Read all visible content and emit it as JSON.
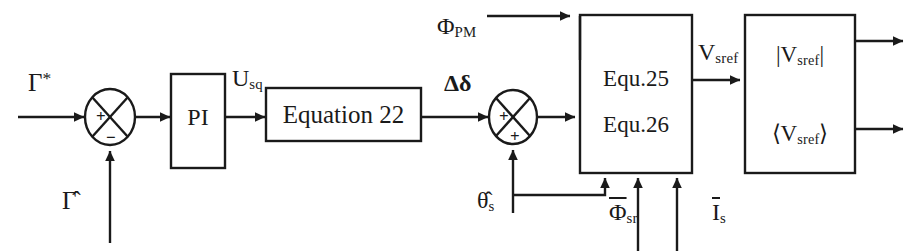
{
  "diagram": {
    "line_color": "#1a1a1a",
    "text_color": "#1a1a1a",
    "background_color": "#ffffff"
  },
  "blocks": [
    {
      "id": "pi",
      "label": "PI",
      "x": 171,
      "y": 74,
      "w": 54,
      "h": 94
    },
    {
      "id": "equation22",
      "label": "Equation 22",
      "x": 266,
      "y": 88,
      "w": 155,
      "h": 53
    },
    {
      "id": "equ2526",
      "label_line1": "Equ.25",
      "label_line2": "Equ.26",
      "x": 580,
      "y": 15,
      "w": 112,
      "h": 158
    },
    {
      "id": "vsref_out",
      "label_line1": "|V",
      "label_line1_sub": "sref",
      "label_line1_tail": "|",
      "label_line2": "⟨V",
      "label_line2_sub": "sref",
      "label_line2_tail": "⟩",
      "x": 745,
      "y": 15,
      "w": 110,
      "h": 158
    }
  ],
  "summing_junctions": [
    {
      "id": "sum1",
      "cx": 110,
      "cy": 117,
      "rx": 25,
      "ry": 28,
      "left_sign": "+",
      "bottom_sign": "−"
    },
    {
      "id": "sum2",
      "cx": 513,
      "cy": 117,
      "rx": 24,
      "ry": 27,
      "left_sign": "+",
      "bottom_sign": "+"
    }
  ],
  "signals": {
    "torque_ref": {
      "base": "Γ",
      "sup": "*",
      "x": 28,
      "y": 78
    },
    "torque_est": {
      "base": "Γ̂",
      "x": 63,
      "y": 197
    },
    "pi_output": {
      "base": "U",
      "sub": "sq",
      "x": 232,
      "y": 73
    },
    "delta_delta": {
      "base": "Δδ",
      "x": 444,
      "y": 78
    },
    "flux_pm": {
      "base": "Φ",
      "sub": "PM",
      "x": 440,
      "y": 18
    },
    "theta_s_est": {
      "base": "θ̂",
      "sub": "s",
      "x": 477,
      "y": 196
    },
    "flux_sr_bar": {
      "base": "Φ",
      "sub": "sr",
      "overline": true,
      "x": 611,
      "y": 208
    },
    "current_s_bar": {
      "base": "I",
      "sub": "s",
      "overline": true,
      "x": 711,
      "y": 208
    },
    "v_sref": {
      "base": "V",
      "sub": "sref",
      "x": 700,
      "y": 47
    }
  },
  "block_labels": {
    "pi": "PI",
    "equation22": "Equation 22",
    "equ25": "Equ.25",
    "equ26": "Equ.26",
    "vsref_mag": "|V",
    "vsref_mag_sub": "sref",
    "vsref_mag_tail": "|",
    "vsref_ang": "⟨V",
    "vsref_ang_sub": "sref",
    "vsref_ang_tail": "⟩"
  }
}
